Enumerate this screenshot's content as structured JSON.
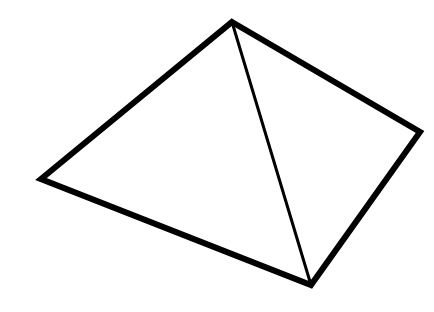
{
  "figure": {
    "title": "Pyramid line drawing",
    "background": "#ffffff",
    "stroke_color": "#000000",
    "outline_width": 6,
    "edge_width": 3,
    "vertices": {
      "apex": [
        232,
        22
      ],
      "left": [
        41,
        179
      ],
      "right": [
        420,
        132
      ],
      "bottom": [
        311,
        285
      ]
    },
    "outline_points": "232,22 420,132 311,285 41,179",
    "inner_edge": {
      "x1": 232,
      "y1": 22,
      "x2": 311,
      "y2": 285
    }
  }
}
